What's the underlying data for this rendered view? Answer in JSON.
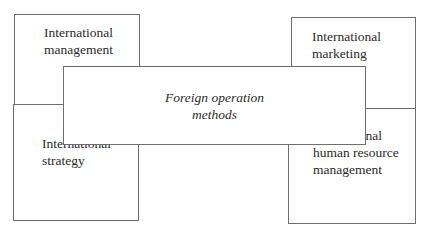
{
  "diagram": {
    "center": {
      "label": "Foreign operation\nmethods"
    },
    "top_left": {
      "label": "International\nmanagement"
    },
    "top_right": {
      "label": "International\nmarketing"
    },
    "bottom_left": {
      "label": "International\nstrategy"
    },
    "bottom_right": {
      "label": "International\nhuman resource\nmanagement"
    }
  }
}
